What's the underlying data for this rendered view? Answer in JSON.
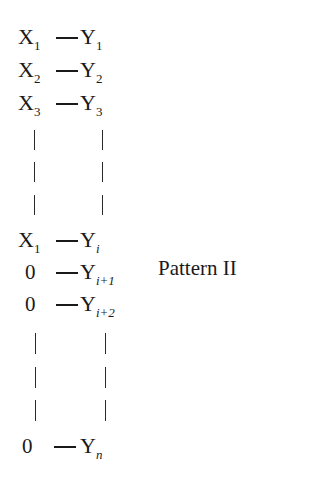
{
  "figure": {
    "label": "Pattern II",
    "rows": [
      {
        "lhs": "X",
        "lhs_sub": "1",
        "rhs": "Y",
        "rhs_sub": "1"
      },
      {
        "lhs": "X",
        "lhs_sub": "2",
        "rhs": "Y",
        "rhs_sub": "2"
      },
      {
        "lhs": "X",
        "lhs_sub": "3",
        "rhs": "Y",
        "rhs_sub": "3"
      },
      {
        "lhs": "X",
        "lhs_sub": "1",
        "rhs": "Y",
        "rhs_sub": "i"
      },
      {
        "lhs": "0",
        "lhs_sub": "",
        "rhs": "Y",
        "rhs_sub": "i+1"
      },
      {
        "lhs": "0",
        "lhs_sub": "",
        "rhs": "Y",
        "rhs_sub": "i+2"
      },
      {
        "lhs": "0",
        "lhs_sub": "",
        "rhs": "Y",
        "rhs_sub": "n"
      }
    ]
  }
}
